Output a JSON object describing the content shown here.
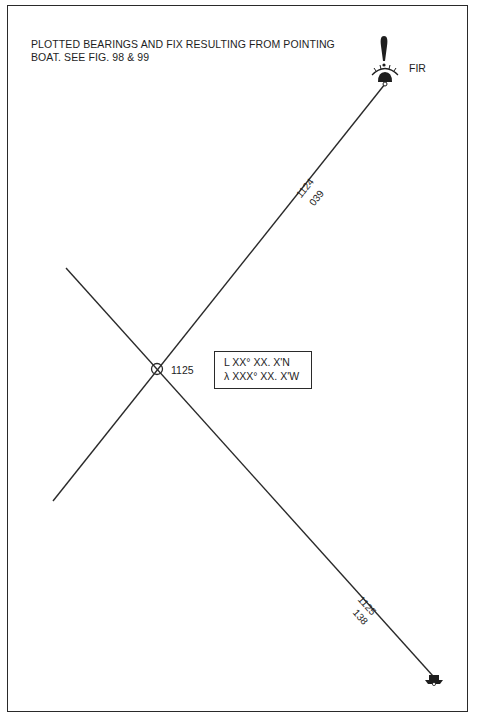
{
  "figure": {
    "title_line1": "PLOTTED BEARINGS AND FIX RESULTING FROM POINTING",
    "title_line2": "BOAT.  SEE FIG. 98 & 99"
  },
  "landmarks": {
    "buoy": {
      "symbol": "bell-buoy",
      "label": "FIR"
    },
    "boat": {
      "symbol": "boat"
    }
  },
  "bearings": [
    {
      "time": "1124",
      "bearing": "039"
    },
    {
      "time": "1125",
      "bearing": "138"
    }
  ],
  "fix": {
    "time": "1125",
    "latitude": "L XX° XX. X'N",
    "longitude": "λ XXX° XX. X'W"
  },
  "colors": {
    "ink": "#2a2a2a",
    "background": "#ffffff"
  }
}
